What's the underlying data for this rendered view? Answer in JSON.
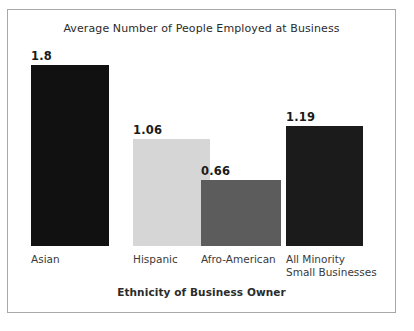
{
  "chart_data": {
    "type": "bar",
    "title": "Average Number of People Employed at Business",
    "xlabel": "Ethnicity of Business Owner",
    "ylabel": "",
    "categories": [
      "Asian",
      "Hispanic",
      "Afro-American",
      "All Minority Small Businesses"
    ],
    "category_lines": [
      [
        "Asian"
      ],
      [
        "Hispanic"
      ],
      [
        "Afro-American"
      ],
      [
        "All Minority",
        "Small Businesses"
      ]
    ],
    "values": [
      1.8,
      1.06,
      0.66,
      1.19
    ],
    "value_labels": [
      "1.8",
      "1.06",
      "0.66",
      "1.19"
    ],
    "bar_colors": [
      "#111111",
      "#d6d6d6",
      "#5c5c5c",
      "#1b1b1b"
    ],
    "ylim": [
      0,
      1.8
    ],
    "grid": false,
    "legend": false,
    "axis_visible": false
  },
  "figure": {
    "border_color": "#a8a8a8",
    "background": "#ffffff"
  }
}
